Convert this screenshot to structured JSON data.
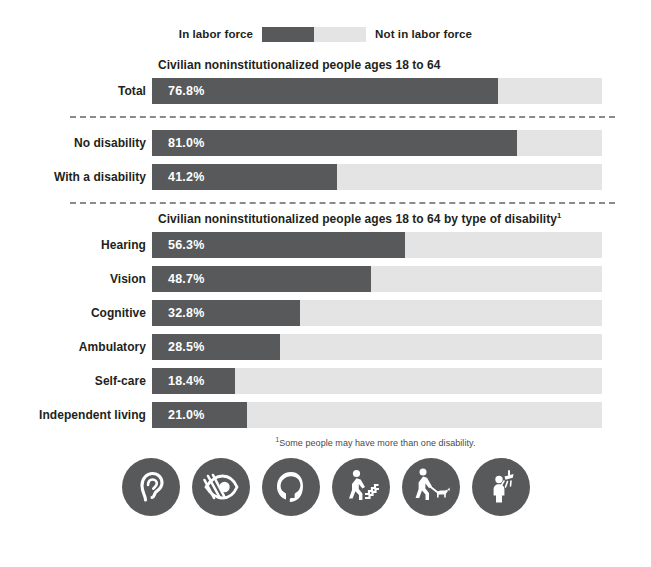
{
  "legend": {
    "left_label": "In labor force",
    "right_label": "Not in labor force",
    "dark_color": "#58595b",
    "light_color": "#e4e4e4"
  },
  "section1": {
    "title": "Civilian noninstitutionalized people ages 18 to 64"
  },
  "section3": {
    "title": "Civilian noninstitutionalized people ages 18 to 64 by type of disability",
    "title_superscript": "1"
  },
  "footnote": {
    "marker": "1",
    "text": "Some people may have more than one disability."
  },
  "icons": [
    {
      "name": "ear-hearing-icon"
    },
    {
      "name": "crossed-eye-vision-icon"
    },
    {
      "name": "head-profile-cognitive-icon"
    },
    {
      "name": "person-stairs-ambulatory-icon"
    },
    {
      "name": "person-guide-dog-icon"
    },
    {
      "name": "person-shower-selfcare-icon"
    }
  ],
  "chart_data": {
    "type": "bar",
    "title": "Civilian noninstitutionalized people ages 18 to 64",
    "xlabel": "",
    "ylabel": "",
    "xlim": [
      0,
      100
    ],
    "grid": false,
    "legend_position": "top-center",
    "orientation": "horizontal",
    "stacked": true,
    "unit": "percent",
    "series": [
      {
        "name": "In labor force",
        "color": "#58595b"
      },
      {
        "name": "Not in labor force",
        "color": "#e4e4e4"
      }
    ],
    "groups": [
      {
        "title": "Civilian noninstitutionalized people ages 18 to 64",
        "categories": [
          "Total"
        ],
        "values": [
          76.8
        ],
        "labels": [
          "76.8%"
        ]
      },
      {
        "title": "",
        "categories": [
          "No disability",
          "With a disability"
        ],
        "values": [
          81.0,
          41.2
        ],
        "labels": [
          "81.0%",
          "41.2%"
        ]
      },
      {
        "title": "Civilian noninstitutionalized people ages 18 to 64 by type of disability",
        "categories": [
          "Hearing",
          "Vision",
          "Cognitive",
          "Ambulatory",
          "Self-care",
          "Independent living"
        ],
        "values": [
          56.3,
          48.7,
          32.8,
          28.5,
          18.4,
          21.0
        ],
        "labels": [
          "56.3%",
          "48.7%",
          "32.8%",
          "28.5%",
          "18.4%",
          "21.0%"
        ]
      }
    ]
  }
}
